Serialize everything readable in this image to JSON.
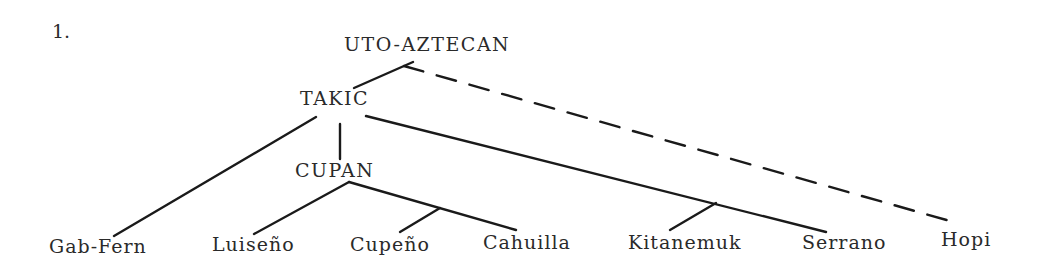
{
  "figure": {
    "number": "1."
  },
  "nodes": {
    "root": "UTO-AZTECAN",
    "takic": "TAKIC",
    "cupan": "CUPAN"
  },
  "leaves": [
    {
      "label": "Gab-Fern",
      "parent": "TAKIC"
    },
    {
      "label": "Luiseño",
      "parent": "CUPAN"
    },
    {
      "label": "Cupeño",
      "parent": "CUPAN"
    },
    {
      "label": "Cahuilla",
      "parent": "CUPAN"
    },
    {
      "label": "Kitanemuk",
      "parent": "TAKIC"
    },
    {
      "label": "Serrano",
      "parent": "TAKIC"
    },
    {
      "label": "Hopi",
      "parent": "UTO-AZTECAN",
      "link": "dashed"
    }
  ],
  "colors": {
    "ink": "#1a1a1a",
    "text": "#2a2a2a",
    "background": "#ffffff"
  }
}
